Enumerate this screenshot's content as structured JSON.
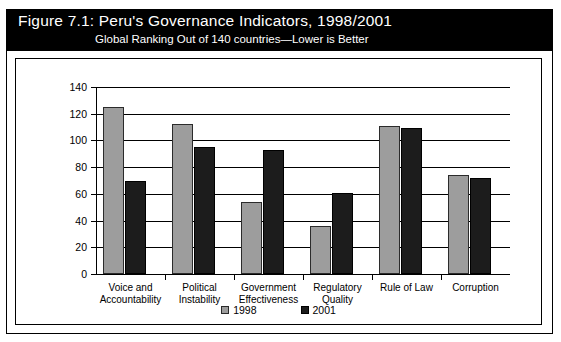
{
  "figure": {
    "title_prefix": "Figure 7.1:",
    "title": "Figure 7.1:  Peru's Governance Indicators, 1998/2001",
    "subtitle": "Global Ranking Out of 140 countries—Lower is Better"
  },
  "legend": {
    "items": [
      {
        "label": "1998",
        "color": "#9d9d9d",
        "swatch": "legend-swatch-1998"
      },
      {
        "label": "2001",
        "color": "#1c1c1c",
        "swatch": "legend-swatch-2001"
      }
    ]
  },
  "chart_data": {
    "type": "bar",
    "title": "Figure 7.1:  Peru's Governance Indicators, 1998/2001",
    "subtitle": "Global Ranking Out of 140 countries—Lower is Better",
    "xlabel": "",
    "ylabel": "",
    "ylim": [
      0,
      140
    ],
    "yticks": [
      0,
      20,
      40,
      60,
      80,
      100,
      120,
      140
    ],
    "ytick_labels": [
      "0",
      "20",
      "40",
      "60",
      "80",
      "100",
      "120",
      "140"
    ],
    "grid": true,
    "legend_position": "bottom",
    "categories": [
      "Voice and Accountability",
      "Political Instability",
      "Government Effectiveness",
      "Regulatory Quality",
      "Rule of Law",
      "Corruption"
    ],
    "category_lines": [
      [
        "Voice and",
        "Accountability"
      ],
      [
        "Political",
        "Instability"
      ],
      [
        "Government",
        "Effectiveness"
      ],
      [
        "Regulatory",
        "Quality"
      ],
      [
        "Rule of Law",
        ""
      ],
      [
        "Corruption",
        ""
      ]
    ],
    "series": [
      {
        "name": "1998",
        "color": "#9d9d9d",
        "values": [
          125,
          112,
          54,
          36,
          111,
          74
        ]
      },
      {
        "name": "2001",
        "color": "#1c1c1c",
        "values": [
          70,
          95,
          93,
          61,
          109,
          72
        ]
      }
    ]
  }
}
